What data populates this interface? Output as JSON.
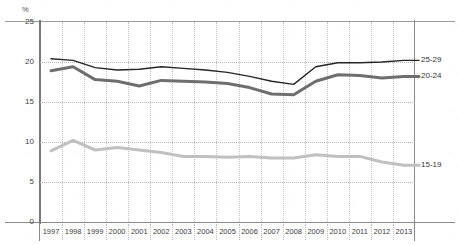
{
  "chart_data": {
    "type": "line",
    "title": "",
    "xlabel": "",
    "ylabel": "%",
    "yunit": "%",
    "ylim": [
      0,
      25
    ],
    "yticks": [
      25,
      20,
      15,
      10,
      5,
      0
    ],
    "ytick_labels": [
      "25",
      "20",
      "15",
      "10",
      "5",
      "0"
    ],
    "grid": true,
    "legend_position": "right-inline",
    "categories": [
      "1997",
      "1998",
      "1999",
      "2000",
      "2001",
      "2002",
      "2003",
      "2004",
      "2005",
      "2006",
      "2007",
      "2008",
      "2009",
      "2010",
      "2011",
      "2012",
      "2013"
    ],
    "series": [
      {
        "name": "25-29",
        "label": "25-29",
        "color": "#262626",
        "width": 1.4,
        "values": [
          20.4,
          20.2,
          19.3,
          19.0,
          19.1,
          19.4,
          19.2,
          19.0,
          18.7,
          18.2,
          17.6,
          17.2,
          19.4,
          19.9,
          19.9,
          20.0,
          20.2
        ]
      },
      {
        "name": "20-24",
        "label": "20-24",
        "color": "#6e6e6e",
        "width": 3.0,
        "values": [
          18.9,
          19.4,
          17.8,
          17.6,
          17.0,
          17.7,
          17.6,
          17.5,
          17.3,
          16.8,
          16.0,
          15.9,
          17.6,
          18.4,
          18.3,
          18.0,
          18.2
        ]
      },
      {
        "name": "15-19",
        "label": "15-19",
        "color": "#c0c0c0",
        "width": 3.0,
        "values": [
          8.9,
          10.2,
          9.0,
          9.3,
          9.0,
          8.7,
          8.2,
          8.2,
          8.1,
          8.2,
          8.0,
          8.0,
          8.4,
          8.2,
          8.2,
          7.5,
          7.1
        ]
      }
    ]
  },
  "axis": {
    "y_unit_label": "%",
    "y_tick_labels": [
      "25",
      "20",
      "15",
      "10",
      "5",
      "0"
    ],
    "x_tick_labels": [
      "1997",
      "1998",
      "1999",
      "2000",
      "2001",
      "2002",
      "2003",
      "2004",
      "2005",
      "2006",
      "2007",
      "2008",
      "2009",
      "2010",
      "2011",
      "2012",
      "2013"
    ]
  },
  "legend": {
    "entries": [
      {
        "label": "25-29"
      },
      {
        "label": "20-24"
      },
      {
        "label": "15-19"
      }
    ]
  },
  "colors": {
    "series_25_29": "#262626",
    "series_20_24": "#6e6e6e",
    "series_15_19": "#c0c0c0",
    "axis": "#8a8a8a",
    "grid": "#bdbdbd",
    "text": "#3d3d3d"
  }
}
